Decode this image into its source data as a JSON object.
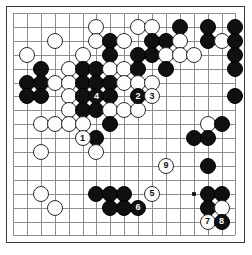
{
  "diagram": {
    "kind": "go-board-diagram",
    "board_size_shown": 17,
    "grid": {
      "origin_x": 13,
      "origin_y": 13,
      "spacing": 13.9,
      "cols": 17,
      "rows": 17
    },
    "colors": {
      "background": "#ffffff",
      "board": "#ffffff",
      "gridline": "#8d8d8d",
      "border": "#3a3a3a",
      "black_stone": "#101010",
      "white_stone": "#fdfdfd",
      "black_label": "#ffffff",
      "white_label": "#121212"
    },
    "star_points": [
      {
        "col": 2,
        "row": 8
      },
      {
        "col": 2,
        "row": 13
      },
      {
        "col": 13,
        "row": 13
      },
      {
        "col": 8,
        "row": 13
      }
    ],
    "stones": [
      {
        "col": 6,
        "row": 1,
        "color": "white",
        "label": ""
      },
      {
        "col": 9,
        "row": 1,
        "color": "white",
        "label": ""
      },
      {
        "col": 10,
        "row": 1,
        "color": "white",
        "label": ""
      },
      {
        "col": 12,
        "row": 1,
        "color": "black",
        "label": ""
      },
      {
        "col": 14,
        "row": 1,
        "color": "black",
        "label": ""
      },
      {
        "col": 16,
        "row": 1,
        "color": "black",
        "label": ""
      },
      {
        "col": 3,
        "row": 2,
        "color": "white",
        "label": ""
      },
      {
        "col": 6,
        "row": 2,
        "color": "white",
        "label": ""
      },
      {
        "col": 7,
        "row": 2,
        "color": "black",
        "label": ""
      },
      {
        "col": 8,
        "row": 2,
        "color": "white",
        "label": ""
      },
      {
        "col": 10,
        "row": 2,
        "color": "black",
        "label": ""
      },
      {
        "col": 11,
        "row": 2,
        "color": "black",
        "label": ""
      },
      {
        "col": 12,
        "row": 2,
        "color": "white",
        "label": ""
      },
      {
        "col": 14,
        "row": 2,
        "color": "black",
        "label": ""
      },
      {
        "col": 15,
        "row": 2,
        "color": "white",
        "label": ""
      },
      {
        "col": 16,
        "row": 2,
        "color": "black",
        "label": ""
      },
      {
        "col": 1,
        "row": 3,
        "color": "white",
        "label": ""
      },
      {
        "col": 5,
        "row": 3,
        "color": "white",
        "label": ""
      },
      {
        "col": 7,
        "row": 3,
        "color": "black",
        "label": ""
      },
      {
        "col": 9,
        "row": 3,
        "color": "black",
        "label": ""
      },
      {
        "col": 10,
        "row": 3,
        "color": "black",
        "label": ""
      },
      {
        "col": 11,
        "row": 3,
        "color": "white",
        "label": ""
      },
      {
        "col": 12,
        "row": 3,
        "color": "white",
        "label": ""
      },
      {
        "col": 13,
        "row": 3,
        "color": "white",
        "label": ""
      },
      {
        "col": 16,
        "row": 3,
        "color": "black",
        "label": ""
      },
      {
        "col": 2,
        "row": 4,
        "color": "black",
        "label": ""
      },
      {
        "col": 4,
        "row": 4,
        "color": "white",
        "label": ""
      },
      {
        "col": 5,
        "row": 4,
        "color": "black",
        "label": ""
      },
      {
        "col": 6,
        "row": 4,
        "color": "black",
        "label": ""
      },
      {
        "col": 7,
        "row": 4,
        "color": "white",
        "label": ""
      },
      {
        "col": 8,
        "row": 4,
        "color": "white",
        "label": ""
      },
      {
        "col": 9,
        "row": 4,
        "color": "black",
        "label": ""
      },
      {
        "col": 11,
        "row": 4,
        "color": "black",
        "label": ""
      },
      {
        "col": 16,
        "row": 4,
        "color": "black",
        "label": ""
      },
      {
        "col": 1,
        "row": 5,
        "color": "black",
        "label": ""
      },
      {
        "col": 2,
        "row": 5,
        "color": "black",
        "label": ""
      },
      {
        "col": 3,
        "row": 5,
        "color": "white",
        "label": ""
      },
      {
        "col": 4,
        "row": 5,
        "color": "white",
        "label": ""
      },
      {
        "col": 5,
        "row": 5,
        "color": "black",
        "label": ""
      },
      {
        "col": 6,
        "row": 5,
        "color": "black",
        "label": ""
      },
      {
        "col": 7,
        "row": 5,
        "color": "black",
        "label": ""
      },
      {
        "col": 8,
        "row": 5,
        "color": "white",
        "label": ""
      },
      {
        "col": 9,
        "row": 5,
        "color": "white",
        "label": ""
      },
      {
        "col": 10,
        "row": 5,
        "color": "white",
        "label": ""
      },
      {
        "col": 1,
        "row": 6,
        "color": "black",
        "label": ""
      },
      {
        "col": 2,
        "row": 6,
        "color": "black",
        "label": ""
      },
      {
        "col": 4,
        "row": 6,
        "color": "white",
        "label": ""
      },
      {
        "col": 5,
        "row": 6,
        "color": "black",
        "label": ""
      },
      {
        "col": 6,
        "row": 6,
        "color": "black",
        "label": "4"
      },
      {
        "col": 7,
        "row": 6,
        "color": "black",
        "label": ""
      },
      {
        "col": 9,
        "row": 6,
        "color": "black",
        "label": "2"
      },
      {
        "col": 10,
        "row": 6,
        "color": "white",
        "label": "3"
      },
      {
        "col": 16,
        "row": 6,
        "color": "black",
        "label": ""
      },
      {
        "col": 4,
        "row": 7,
        "color": "white",
        "label": ""
      },
      {
        "col": 5,
        "row": 7,
        "color": "black",
        "label": ""
      },
      {
        "col": 6,
        "row": 7,
        "color": "black",
        "label": ""
      },
      {
        "col": 7,
        "row": 7,
        "color": "white",
        "label": ""
      },
      {
        "col": 8,
        "row": 7,
        "color": "white",
        "label": ""
      },
      {
        "col": 9,
        "row": 7,
        "color": "white",
        "label": ""
      },
      {
        "col": 2,
        "row": 8,
        "color": "white",
        "label": ""
      },
      {
        "col": 3,
        "row": 8,
        "color": "white",
        "label": ""
      },
      {
        "col": 4,
        "row": 8,
        "color": "white",
        "label": ""
      },
      {
        "col": 5,
        "row": 8,
        "color": "white",
        "label": ""
      },
      {
        "col": 7,
        "row": 8,
        "color": "black",
        "label": ""
      },
      {
        "col": 14,
        "row": 8,
        "color": "white",
        "label": ""
      },
      {
        "col": 15,
        "row": 8,
        "color": "black",
        "label": ""
      },
      {
        "col": 5,
        "row": 9,
        "color": "white",
        "label": "1"
      },
      {
        "col": 6,
        "row": 9,
        "color": "black",
        "label": ""
      },
      {
        "col": 13,
        "row": 9,
        "color": "black",
        "label": ""
      },
      {
        "col": 14,
        "row": 9,
        "color": "black",
        "label": ""
      },
      {
        "col": 2,
        "row": 10,
        "color": "white",
        "label": ""
      },
      {
        "col": 6,
        "row": 10,
        "color": "white",
        "label": ""
      },
      {
        "col": 11,
        "row": 11,
        "color": "white",
        "label": "9"
      },
      {
        "col": 14,
        "row": 11,
        "color": "black",
        "label": ""
      },
      {
        "col": 2,
        "row": 13,
        "color": "white",
        "label": ""
      },
      {
        "col": 6,
        "row": 13,
        "color": "black",
        "label": ""
      },
      {
        "col": 7,
        "row": 13,
        "color": "black",
        "label": ""
      },
      {
        "col": 8,
        "row": 13,
        "color": "black",
        "label": ""
      },
      {
        "col": 10,
        "row": 13,
        "color": "white",
        "label": "5"
      },
      {
        "col": 14,
        "row": 13,
        "color": "black",
        "label": ""
      },
      {
        "col": 15,
        "row": 13,
        "color": "black",
        "label": ""
      },
      {
        "col": 3,
        "row": 14,
        "color": "white",
        "label": ""
      },
      {
        "col": 7,
        "row": 14,
        "color": "black",
        "label": ""
      },
      {
        "col": 8,
        "row": 14,
        "color": "black",
        "label": ""
      },
      {
        "col": 9,
        "row": 14,
        "color": "black",
        "label": "6"
      },
      {
        "col": 14,
        "row": 14,
        "color": "black",
        "label": ""
      },
      {
        "col": 15,
        "row": 14,
        "color": "white",
        "label": ""
      },
      {
        "col": 14,
        "row": 15,
        "color": "white",
        "label": "7"
      },
      {
        "col": 15,
        "row": 15,
        "color": "black",
        "label": "8"
      }
    ],
    "move_labels": [
      "1",
      "2",
      "3",
      "4",
      "5",
      "6",
      "7",
      "8",
      "9"
    ]
  }
}
